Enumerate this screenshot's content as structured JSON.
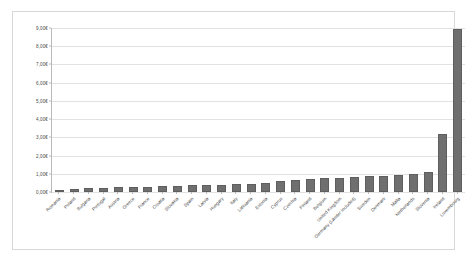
{
  "chart_data": {
    "type": "bar",
    "title": "",
    "subtitle": "",
    "xlabel": "",
    "ylabel": "",
    "ylim": [
      0,
      9
    ],
    "ytick_labels": [
      "0,00€",
      "1,00€",
      "2,00€",
      "3,00€",
      "4,00€",
      "5,00€",
      "6,00€",
      "7,00€",
      "8,00€",
      "9,00€"
    ],
    "ytick_values": [
      0,
      1,
      2,
      3,
      4,
      5,
      6,
      7,
      8,
      9
    ],
    "grid": true,
    "legend": "none",
    "categories": [
      "Romania",
      "Poland",
      "Bulgaria",
      "Portugal",
      "Austria",
      "Greece",
      "France",
      "Croatia",
      "Slovakia",
      "Spain",
      "Latvia",
      "Hungary",
      "Italy",
      "Lithuania",
      "Estonia",
      "Cyprus",
      "Czechia",
      "Finland",
      "Belgium",
      "United Kingdom",
      "Germany (Länder included)",
      "Sweden",
      "Denmark",
      "Malta",
      "Netherlands",
      "Slovenia",
      "Ireland",
      "Luxembourg"
    ],
    "values": [
      0.07,
      0.19,
      0.22,
      0.24,
      0.27,
      0.29,
      0.3,
      0.32,
      0.33,
      0.36,
      0.38,
      0.4,
      0.44,
      0.45,
      0.47,
      0.62,
      0.68,
      0.72,
      0.75,
      0.79,
      0.82,
      0.86,
      0.88,
      0.93,
      1.0,
      1.12,
      3.2,
      8.95
    ],
    "bar_color": "#6f6f6f",
    "plot_background": "#ffffff",
    "gridline_color": "#e2e2e2",
    "axis_color": "#b9b9b9"
  },
  "caption": {
    "text": ""
  }
}
